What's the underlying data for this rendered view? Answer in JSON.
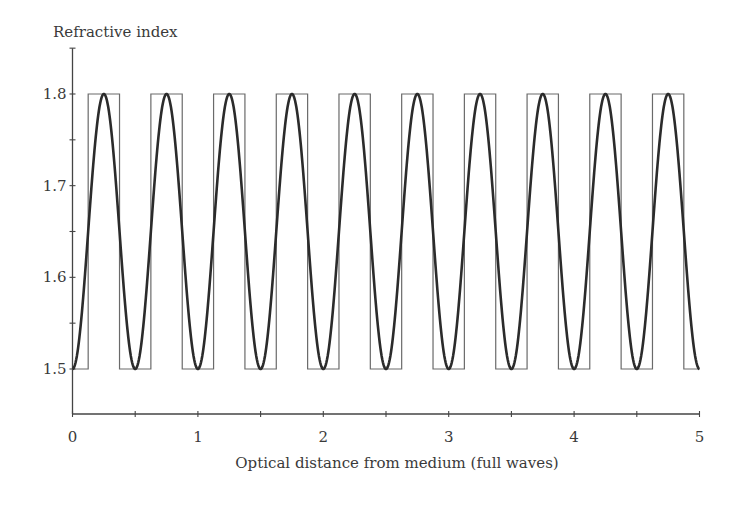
{
  "chart_data": {
    "type": "line",
    "title": "",
    "ylabel": "Refractive index",
    "xlabel": "Optical distance from medium (full waves)",
    "xlim": [
      0,
      5
    ],
    "ylim": [
      1.5,
      1.85
    ],
    "x_ticks": [
      0,
      0.5,
      1,
      1.5,
      2,
      2.5,
      3,
      3.5,
      4,
      4.5,
      5
    ],
    "x_tick_labels": [
      "0",
      "",
      "1",
      "",
      "2",
      "",
      "3",
      "",
      "4",
      "",
      "5"
    ],
    "y_ticks": [
      1.5,
      1.55,
      1.6,
      1.65,
      1.7,
      1.75,
      1.8,
      1.85
    ],
    "y_tick_labels": [
      "1.5",
      "",
      "1.6",
      "",
      "1.7",
      "",
      "1.8",
      ""
    ],
    "grid": false,
    "legend": null,
    "series": [
      {
        "name": "sinusoidal index profile",
        "style": "thick dark line",
        "formula": "n(x) = 1.65 - 0.15*cos(4*pi*x)",
        "min": 1.5,
        "max": 1.8,
        "period": 0.5,
        "peaks_at": [
          0.25,
          0.75,
          1.25,
          1.75,
          2.25,
          2.75,
          3.25,
          3.75,
          4.25,
          4.75
        ]
      },
      {
        "name": "square-wave index profile",
        "style": "thin gray line",
        "low": 1.5,
        "high": 1.8,
        "high_intervals": [
          [
            0.125,
            0.375
          ],
          [
            0.625,
            0.875
          ],
          [
            1.125,
            1.375
          ],
          [
            1.625,
            1.875
          ],
          [
            2.125,
            2.375
          ],
          [
            2.625,
            2.875
          ],
          [
            3.125,
            3.375
          ],
          [
            3.625,
            3.875
          ],
          [
            4.125,
            4.375
          ],
          [
            4.625,
            4.875
          ]
        ]
      }
    ]
  }
}
